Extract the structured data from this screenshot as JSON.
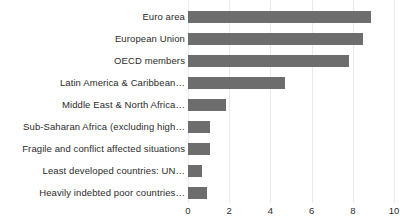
{
  "chart_data": {
    "type": "bar",
    "orientation": "horizontal",
    "title": "",
    "subtitle": "",
    "xlabel": "",
    "ylabel": "",
    "xlim": [
      0,
      10
    ],
    "xticks": [
      0,
      2,
      4,
      6,
      8,
      10
    ],
    "xtick_labels": [
      "0",
      "2",
      "4",
      "6",
      "8",
      "10"
    ],
    "grid": true,
    "grid_axis": "x",
    "legend": false,
    "legend_position": "none",
    "bar_color": "#6d6d6d",
    "background_color": "#ffffff",
    "gridline_color": "#eaeaea",
    "categories": [
      "Euro area",
      "European Union",
      "OECD members",
      "Latin America & Caribbean…",
      "Middle East & North Africa…",
      "Sub-Saharan Africa (excluding high…",
      "Fragile and conflict affected situations",
      "Least developed countries: UN…",
      "Heavily indebted poor countries…"
    ],
    "values": [
      8.9,
      8.5,
      7.8,
      4.7,
      1.85,
      1.05,
      1.05,
      0.7,
      0.9
    ]
  }
}
